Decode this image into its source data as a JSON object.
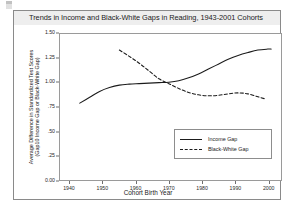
{
  "chart_data": {
    "type": "line",
    "title": "Trends in Income and Black-White Gaps in Reading, 1943-2001 Cohorts",
    "xlabel": "Cohort Birth Year",
    "ylabel_line1": "Average Difference in Standardized Test Scores",
    "ylabel_line2": "(Gap10 Income Gap or Black-White Gap)",
    "xlim": [
      1937,
      2004
    ],
    "ylim": [
      0.0,
      1.5
    ],
    "xticks": [
      1940,
      1950,
      1960,
      1970,
      1980,
      1990,
      2000
    ],
    "xtick_labels": [
      "1940",
      "1950",
      "1960",
      "1970",
      "1980",
      "1990",
      "2000"
    ],
    "yticks": [
      0.0,
      0.25,
      0.5,
      0.75,
      1.0,
      1.25,
      1.5
    ],
    "ytick_labels": [
      "0.00",
      ".25",
      ".50",
      ".75",
      "1.00",
      "1.25",
      "1.50"
    ],
    "grid": false,
    "legend_position": "lower-right",
    "series": [
      {
        "name": "Income Gap",
        "style": "solid",
        "color": "#1b1b1b",
        "x": [
          1943,
          1946,
          1949,
          1952,
          1955,
          1958,
          1961,
          1964,
          1967,
          1970,
          1973,
          1976,
          1979,
          1982,
          1985,
          1988,
          1991,
          1994,
          1997,
          2000,
          2001
        ],
        "y": [
          0.79,
          0.85,
          0.91,
          0.95,
          0.975,
          0.985,
          0.99,
          0.995,
          1.0,
          1.005,
          1.02,
          1.05,
          1.09,
          1.14,
          1.19,
          1.24,
          1.28,
          1.31,
          1.335,
          1.345,
          1.345
        ]
      },
      {
        "name": "Black-White Gap",
        "style": "dashed",
        "color": "#1b1b1b",
        "x": [
          1955,
          1958,
          1961,
          1964,
          1967,
          1970,
          1973,
          1976,
          1979,
          1982,
          1985,
          1988,
          1991,
          1994,
          1997,
          1999
        ],
        "y": [
          1.335,
          1.27,
          1.2,
          1.12,
          1.04,
          0.99,
          0.94,
          0.9,
          0.875,
          0.865,
          0.87,
          0.885,
          0.895,
          0.885,
          0.855,
          0.835
        ]
      }
    ]
  },
  "legend": {
    "items": [
      {
        "label": "Income Gap",
        "style": "solid"
      },
      {
        "label": "Black-White Gap",
        "style": "dashed"
      }
    ]
  }
}
